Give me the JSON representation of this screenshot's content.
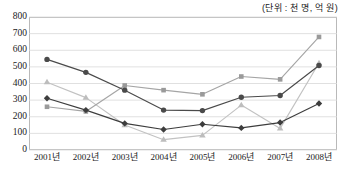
{
  "unit_note": "(단위 : 천 명, 억 원)",
  "chart_data": {
    "type": "line",
    "title": "",
    "subtitle": "",
    "xlabel": "",
    "ylabel": "",
    "unit_note": "(단위 : 천 명, 억 원)",
    "grid": true,
    "legend_position": "none",
    "categories": [
      "2001년",
      "2002년",
      "2003년",
      "2004년",
      "2005년",
      "2006년",
      "2007년",
      "2008년"
    ],
    "ylim": [
      0,
      800
    ],
    "yticks": [
      0,
      100,
      200,
      300,
      400,
      500,
      600,
      700,
      800
    ],
    "ytick_labels": [
      "0",
      "100",
      "200",
      "300",
      "400",
      "500",
      "600",
      "700",
      "800"
    ],
    "series": [
      {
        "name": "series-circle",
        "marker": "circle",
        "color": "#4a4a4a",
        "line_color": "#4a4a4a",
        "values": [
          545,
          467,
          360,
          240,
          237,
          317,
          328,
          508
        ]
      },
      {
        "name": "series-square",
        "marker": "square",
        "color": "#9a9a9a",
        "line_color": "#a5a5a5",
        "values": [
          260,
          232,
          388,
          360,
          335,
          442,
          425,
          680
        ]
      },
      {
        "name": "series-triangle",
        "marker": "triangle",
        "color": "#bdbdbd",
        "line_color": "#c2c2c2",
        "values": [
          408,
          315,
          150,
          62,
          88,
          270,
          130,
          523
        ]
      },
      {
        "name": "series-diamond",
        "marker": "diamond",
        "color": "#3d3d3d",
        "line_color": "#3d3d3d",
        "values": [
          311,
          240,
          160,
          123,
          155,
          133,
          165,
          280
        ]
      }
    ]
  }
}
